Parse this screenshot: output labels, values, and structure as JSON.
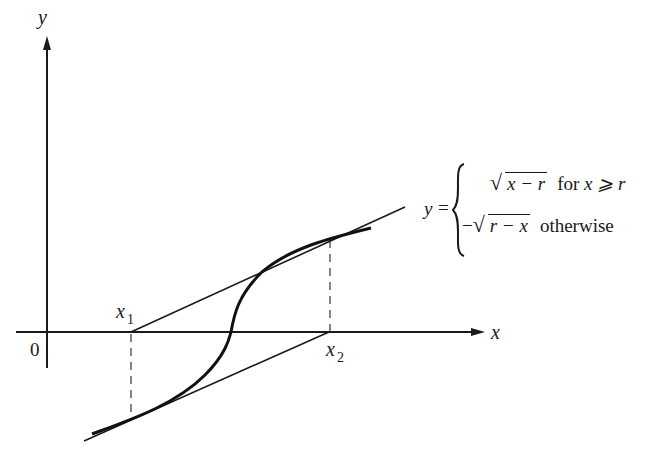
{
  "figure": {
    "type": "diagram",
    "axes": {
      "x_label": "x",
      "y_label": "y",
      "origin_label": "0"
    },
    "points": {
      "x1_label": "x",
      "x1_sub": "1",
      "x2_label": "x",
      "x2_sub": "2"
    },
    "formula": {
      "lhs": "y",
      "equals": "=",
      "case1_radicand": "x − r",
      "case1_condition_prefix": "for",
      "case1_condition": "x ⩾ r",
      "case2_sign": "−",
      "case2_radicand": "r − x",
      "case2_condition": "otherwise"
    },
    "colors": {
      "ink": "#1a1a1a",
      "background": "#ffffff"
    }
  }
}
